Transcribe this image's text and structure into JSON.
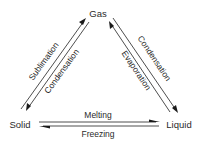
{
  "diagram": {
    "nodes": {
      "gas": "Gas",
      "solid": "Solid",
      "liquid": "Liquid"
    },
    "edges": {
      "solid_to_gas": "Sublimation",
      "gas_to_solid": "Condensation",
      "liquid_to_gas": "Evaporation",
      "gas_to_liquid": "Condensation",
      "solid_to_liquid": "Melting",
      "liquid_to_solid": "Freezing"
    },
    "colors": {
      "line": "#3a3a3a",
      "text": "#2a2a2a",
      "background": "#ffffff"
    }
  }
}
